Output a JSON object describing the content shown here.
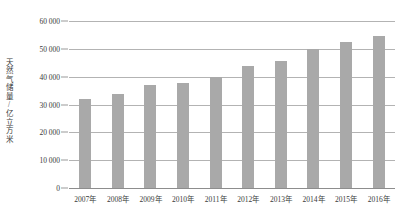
{
  "chart_data": {
    "type": "bar",
    "title": "",
    "subtitle": "",
    "xlabel": "",
    "ylabel": "天然气储量/亿立方米",
    "categories": [
      "2007年",
      "2008年",
      "2009年",
      "2010年",
      "2011年",
      "2012年",
      "2013年",
      "2014年",
      "2015年",
      "2016年"
    ],
    "values": [
      32000,
      33800,
      37000,
      37800,
      40000,
      43800,
      45700,
      50000,
      52500,
      54600
    ],
    "series": [
      {
        "name": "天然气储量",
        "values": [
          32000,
          33800,
          37000,
          37800,
          40000,
          43800,
          45700,
          50000,
          52500,
          54600
        ]
      }
    ],
    "ylim": [
      0,
      60000
    ],
    "yticks": [
      0,
      10000,
      20000,
      30000,
      40000,
      50000,
      60000
    ],
    "ytick_labels": [
      "0",
      "10 000",
      "20 000",
      "30 000",
      "40 000",
      "50 000",
      "60 000"
    ],
    "grid": true,
    "grid_axis": "y",
    "legend": false,
    "legend_position": "none",
    "bar_color": "#a9a9a9",
    "gridline_color": "#b3b3b3",
    "text_color": "#3a3a3a",
    "background_color": "#ffffff"
  }
}
